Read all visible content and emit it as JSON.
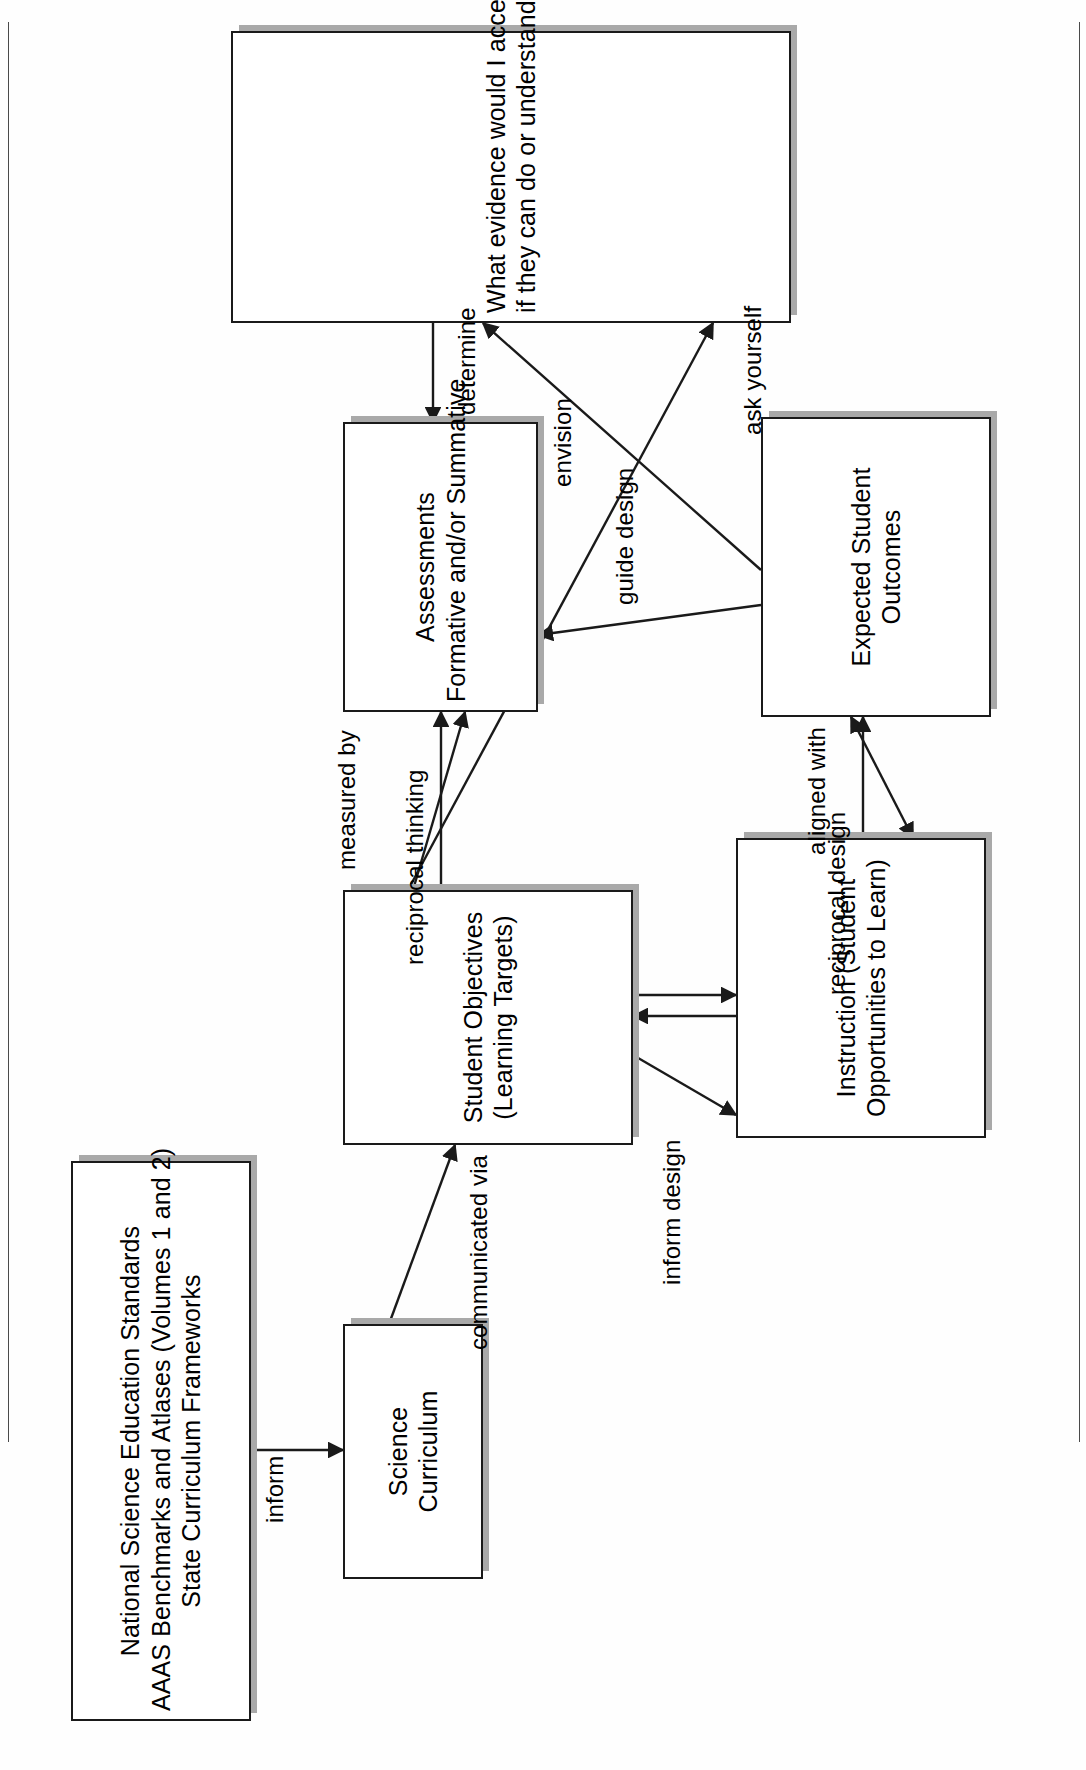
{
  "document": {
    "type": "flowchart-diagram",
    "orientation": "landscape-page-rotated-90-in-portrait-scan",
    "background_color": "#ffffff",
    "line_color": "#1a1a1a",
    "box_shadow_color": "#a9a9a9"
  },
  "nodes": [
    {
      "id": "standards",
      "name": "standards-box",
      "lines": [
        "National Science Education Standards",
        "AAAS Benchmarks and Atlases (Volumes 1 and 2)",
        "State Curriculum Frameworks"
      ]
    },
    {
      "id": "curriculum",
      "name": "science-curriculum-box",
      "lines": [
        "Science",
        "Curriculum"
      ]
    },
    {
      "id": "objectives",
      "name": "student-objectives-box",
      "lines": [
        "Student Objectives",
        "(Learning Targets)"
      ]
    },
    {
      "id": "instruction",
      "name": "instruction-box",
      "lines": [
        "Instruction (Student",
        "Opportunities to Learn)"
      ]
    },
    {
      "id": "outcomes",
      "name": "expected-student-outcomes-box",
      "lines": [
        "Expected Student",
        "Outcomes"
      ]
    },
    {
      "id": "assessments",
      "name": "assessments-box",
      "lines": [
        "Assessments",
        "Formative and/or Summative"
      ]
    },
    {
      "id": "evidence",
      "name": "evidence-question-box",
      "lines": [
        "What evidence would I accept from students",
        "if they can do or understand these?"
      ]
    }
  ],
  "edges": [
    {
      "id": "e1",
      "from": "standards",
      "to": "curriculum",
      "label": "inform"
    },
    {
      "id": "e2",
      "from": "curriculum",
      "to": "objectives",
      "label": "communicated via"
    },
    {
      "id": "e3",
      "from": "objectives",
      "to": "instruction",
      "label": "inform design"
    },
    {
      "id": "e4",
      "from": "instruction",
      "to": "outcomes",
      "label": "aligned with"
    },
    {
      "id": "e5",
      "from": "objectives",
      "to": "outcomes",
      "label": "reciprocal design"
    },
    {
      "id": "e6",
      "from": "instruction",
      "to": "assessments",
      "label": "reciprocal thinking"
    },
    {
      "id": "e7",
      "from": "objectives",
      "to": "assessments",
      "label": "measured by"
    },
    {
      "id": "e8",
      "from": "outcomes",
      "to": "assessments",
      "label": "guide design"
    },
    {
      "id": "e9",
      "from": "outcomes",
      "to": "evidence",
      "label": "envision"
    },
    {
      "id": "e10",
      "from": "evidence",
      "to": "assessments",
      "label": "determine"
    },
    {
      "id": "e11",
      "from": "objectives",
      "to": "evidence",
      "label": "ask yourself"
    }
  ],
  "labels": {
    "inform": "inform",
    "communicated_via": "communicated via",
    "inform_design": "inform design",
    "aligned_with": "aligned with",
    "reciprocal_design": "reciprocal design",
    "reciprocal_thinking": "reciprocal thinking",
    "measured_by": "measured by",
    "guide_design": "guide design",
    "envision": "envision",
    "determine": "determine",
    "ask_yourself": "ask yourself"
  }
}
